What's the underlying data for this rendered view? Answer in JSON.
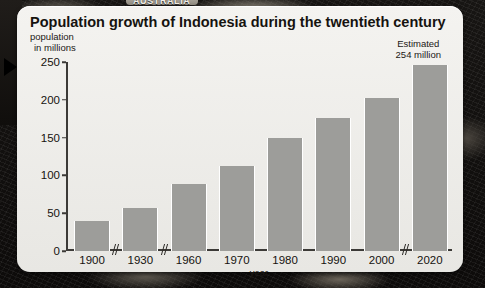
{
  "backdrop": {
    "australia_label": "AUSTRALIA",
    "play_icon": "play-triangle-icon"
  },
  "figure": {
    "title": "Population growth of Indonesia during the twentieth century",
    "y_axis_caption_line1": "population",
    "y_axis_caption_line2": "in millions",
    "estimate_note_line1": "Estimated",
    "estimate_note_line2": "254 million",
    "x_axis_label": "year"
  },
  "chart_data": {
    "type": "bar",
    "title": "Population growth of Indonesia during the twentieth century",
    "xlabel": "year",
    "ylabel": "population in millions",
    "categories": [
      "1900",
      "1930",
      "1960",
      "1970",
      "1980",
      "1990",
      "2000",
      "2020"
    ],
    "values": [
      40,
      57,
      89,
      113,
      149,
      176,
      203,
      246
    ],
    "ylim": [
      0,
      250
    ],
    "yticks": [
      0,
      50,
      100,
      150,
      200,
      250
    ],
    "ytick_labels": [
      "0",
      "50",
      "100",
      "150",
      "200",
      "250"
    ],
    "grid": false,
    "legend": false,
    "axis_breaks_after": [
      "1900",
      "1930",
      "2000"
    ],
    "annotations": [
      {
        "target": "2020",
        "text": "Estimated 254 million"
      }
    ],
    "bar_color": "#9d9d9a"
  },
  "colors": {
    "panel": "#f1f0ec",
    "bar": "#9d9d9a",
    "axis": "#3c3a37",
    "text": "#16130f",
    "backdrop": "#14110f"
  }
}
